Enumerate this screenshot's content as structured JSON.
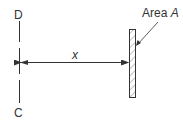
{
  "diagram": {
    "labels": {
      "top": "D",
      "bottom": "C",
      "distance": "x",
      "area_prefix": "Area ",
      "area_symbol": "A"
    },
    "colors": {
      "stroke": "#333333",
      "hatch": "#555555",
      "background": "#ffffff"
    }
  }
}
